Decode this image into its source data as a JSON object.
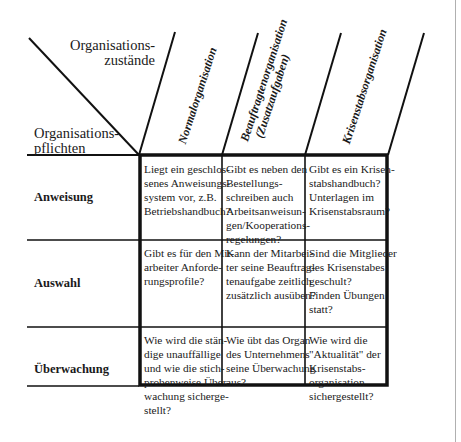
{
  "header": {
    "states_label": [
      "Organisations-",
      "zustände"
    ],
    "duties_label": [
      "Organisations-",
      "pflichten"
    ]
  },
  "columns": [
    {
      "title_lines": [
        "Normalorganisation"
      ]
    },
    {
      "title_lines": [
        "Beauftragtenorganisation",
        "(Zusatzaufgaben)"
      ]
    },
    {
      "title_lines": [
        "Krisenstabsorganisation"
      ]
    }
  ],
  "rows": [
    {
      "label": "Anweisung",
      "cells": [
        [
          "Liegt ein geschlos-",
          "senes Anweisungs-",
          "system vor, z.B.",
          "Betriebshandbuch?"
        ],
        [
          "Gibt es neben den",
          "Bestellungs-",
          "schreiben auch",
          "Arbeitsanweisun-",
          "gen/Kooperations-",
          "regelungen?"
        ],
        [
          "Gibt es ein Krisen-",
          "stabshandbuch?",
          "Unterlagen im",
          "Krisenstabsraum?"
        ]
      ]
    },
    {
      "label": "Auswahl",
      "cells": [
        [
          "Gibt es für den Mit-",
          "arbeiter Anforde-",
          "rungsprofile?"
        ],
        [
          "Kann der Mitarbei-",
          "ter seine Beauftrag-",
          "tenaufgabe zeitlich",
          "zusätzlich ausüben?"
        ],
        [
          "Sind die Mitglieder",
          "des Krisenstabes",
          "geschult?",
          "Finden Übungen",
          "statt?"
        ]
      ]
    },
    {
      "label": "Überwachung",
      "cells": [
        [
          "Wie wird die stän-",
          "dige unauffällige",
          "und wie die stich-",
          "probenweise Über-",
          "wachung sicherge-",
          "stellt?"
        ],
        [
          "Wie übt das Organ",
          "des Unternehmens",
          "seine Überwachung",
          "aus?"
        ],
        [
          "Wie wird die",
          "\"Aktualität\" der",
          "Krisenstabs-",
          "organisation",
          "sichergestellt?"
        ]
      ]
    }
  ],
  "colors": {
    "line": "#111111",
    "text": "#1a1a1a",
    "page_edge": "#b0b0b0"
  }
}
